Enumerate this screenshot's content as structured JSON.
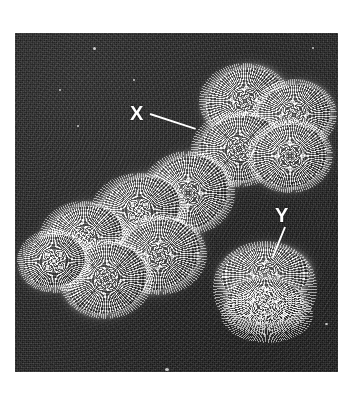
{
  "figure": {
    "kind": "electron-micrograph",
    "subject": "Human X and Y chromosomes",
    "background_color": "#262626",
    "plate_border_color": "#ffffff",
    "label_color": "#ffffff"
  },
  "annotations": [
    {
      "id": "x",
      "text": "X",
      "points_to": "large-chromosome",
      "leader_from": [
        150,
        113
      ],
      "leader_to": [
        196,
        128
      ]
    },
    {
      "id": "y",
      "text": "Y",
      "points_to": "small-chromosome",
      "leader_from": [
        285,
        226
      ],
      "leader_to": [
        272,
        257
      ]
    }
  ],
  "structures": [
    {
      "id": "large-chromosome",
      "name": "X chromosome",
      "description": "Large metacentric chromosome with two sister chromatids running from upper right to lower left"
    },
    {
      "id": "small-chromosome",
      "name": "Y chromosome",
      "description": "Small compact chromosome at lower right with fibrous projections"
    }
  ]
}
